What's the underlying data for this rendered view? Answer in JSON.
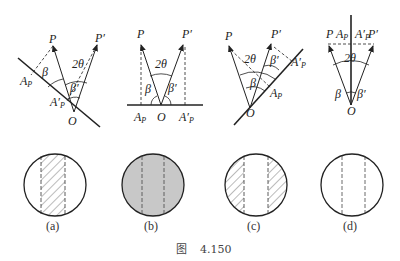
{
  "figure": {
    "caption_prefix": "图",
    "caption_number": "4.150"
  },
  "panels": [
    {
      "id": "a",
      "label": "(a)",
      "vector_labels": {
        "p": "P",
        "p_prime": "P′",
        "o": "O",
        "a_p": "A",
        "a_p_sub": "P",
        "a_p_prime": "A′",
        "a_p_prime_sub": "P"
      },
      "angle_labels": {
        "beta": "β",
        "beta_prime": "β′",
        "two_theta": "2θ"
      },
      "disc_pattern": "central vertical hatched band"
    },
    {
      "id": "b",
      "label": "(b)",
      "vector_labels": {
        "p": "P",
        "p_prime": "P′",
        "o": "O",
        "a_p": "A",
        "a_p_sub": "P",
        "a_p_prime": "A′",
        "a_p_prime_sub": "P"
      },
      "angle_labels": {
        "beta": "β",
        "beta_prime": "β′",
        "two_theta": "2θ"
      },
      "disc_pattern": "fully gray with dashed vertical lines"
    },
    {
      "id": "c",
      "label": "(c)",
      "vector_labels": {
        "p": "P",
        "p_prime": "P′",
        "o": "O",
        "a_p": "A",
        "a_p_sub": "P",
        "a_p_prime": "A′",
        "a_p_prime_sub": "P"
      },
      "angle_labels": {
        "beta": "β",
        "beta_prime": "β′",
        "two_theta": "2θ"
      },
      "disc_pattern": "hatched outer bands, clear center"
    },
    {
      "id": "d",
      "label": "(d)",
      "vector_labels": {
        "p": "P",
        "p_prime": "P′",
        "o": "O",
        "a_p": "A",
        "a_p_sub": "P",
        "a_p_prime": "A′",
        "a_p_prime_sub": "P"
      },
      "angle_labels": {
        "beta": "β",
        "beta_prime": "β′",
        "two_theta": "2θ"
      },
      "disc_pattern": "clear with dashed vertical lines"
    }
  ],
  "colors": {
    "line": "#222222",
    "gray_fill": "#c8c8c8",
    "hatch": "#555555"
  }
}
